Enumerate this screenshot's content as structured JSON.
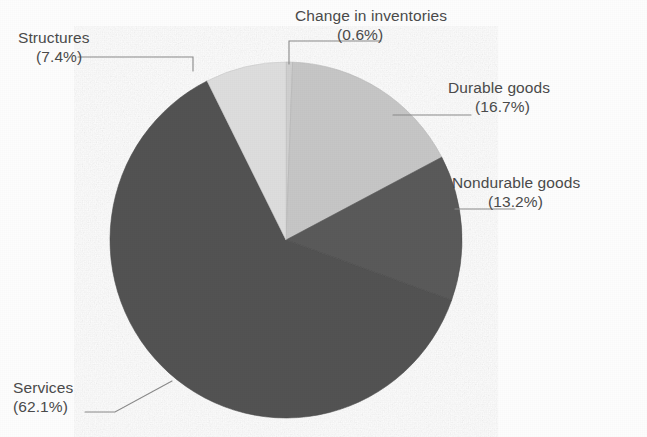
{
  "chart_data": {
    "type": "pie",
    "title": "",
    "subtitle": "",
    "xlabel": "",
    "ylabel": "",
    "legend_position": "none",
    "grid": false,
    "labels_outside": true,
    "start_angle_deg": 0,
    "direction": "clockwise",
    "categories": [
      "Change in inventories",
      "Durable goods",
      "Nondurable goods",
      "Services",
      "Structures"
    ],
    "values": [
      0.6,
      16.7,
      13.2,
      62.1,
      7.4
    ],
    "value_unit": "%",
    "slices": [
      {
        "name": "Change in inventories",
        "percent_text": "(0.6%)",
        "value": 0.6,
        "color": "#cfcfcf",
        "label_line": true
      },
      {
        "name": "Durable goods",
        "percent_text": "(16.7%)",
        "value": 16.7,
        "color": "#c6c6c6",
        "label_line": true
      },
      {
        "name": "Nondurable goods",
        "percent_text": "(13.2%)",
        "value": 13.2,
        "color": "#5a5a5a",
        "label_line": true
      },
      {
        "name": "Services",
        "percent_text": "(62.1%)",
        "value": 62.1,
        "color": "#535353",
        "label_line": true
      },
      {
        "name": "Structures",
        "percent_text": "(7.4%)",
        "value": 7.4,
        "color": "#dddddd",
        "label_line": true
      }
    ]
  },
  "labels": {
    "change_in_inventories": {
      "name": "Change in inventories",
      "pct": "(0.6%)"
    },
    "structures": {
      "name": "Structures",
      "pct": "(7.4%)"
    },
    "durable_goods": {
      "name": "Durable goods",
      "pct": "(16.7%)"
    },
    "nondurable_goods": {
      "name": "Nondurable goods",
      "pct": "(13.2%)"
    },
    "services": {
      "name": "Services",
      "pct": "(62.1%)"
    }
  },
  "colors": {
    "background": "#fdfdfd",
    "text": "#4a4a4a",
    "leader_line": "#8a8a8a",
    "slice_light": "#dddddd",
    "slice_midlight": "#c6c6c6",
    "slice_dark": "#535353",
    "slice_dark_alt": "#5a5a5a",
    "slice_sliver": "#cfcfcf"
  },
  "geometry": {
    "center_x": 286,
    "center_y": 240,
    "radius_x": 176,
    "radius_y": 178
  }
}
